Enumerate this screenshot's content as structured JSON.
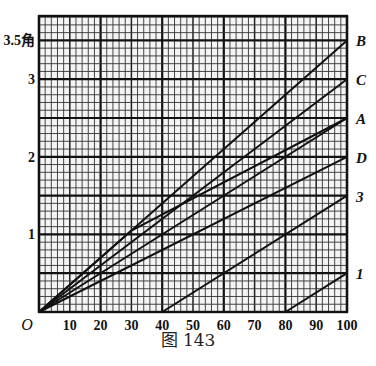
{
  "chart_data": {
    "type": "line",
    "title": "",
    "caption": "图 143",
    "xlabel": "",
    "ylabel": "角",
    "origin_label": "O",
    "xlim": [
      0,
      100
    ],
    "ylim": [
      0,
      3.8
    ],
    "x_ticks": [
      10,
      20,
      30,
      40,
      50,
      60,
      70,
      80,
      90,
      100
    ],
    "y_ticks": [
      {
        "value": 1,
        "label": "1"
      },
      {
        "value": 2,
        "label": "2"
      },
      {
        "value": 3,
        "label": "3"
      },
      {
        "value": 3.5,
        "label": "3.5角"
      }
    ],
    "grid": {
      "minor_x": 2,
      "major_x": 10,
      "heavy_x": 20,
      "minor_y": 0.1,
      "heavy_y": 0.5
    },
    "series": [
      {
        "name": "B",
        "points": [
          [
            0,
            0
          ],
          [
            100,
            3.5
          ]
        ]
      },
      {
        "name": "C",
        "points": [
          [
            0,
            0
          ],
          [
            100,
            3.0
          ]
        ]
      },
      {
        "name": "A",
        "points": [
          [
            0,
            0
          ],
          [
            100,
            2.5
          ]
        ]
      },
      {
        "name": "A-bent",
        "label": "",
        "points": [
          [
            0,
            0
          ],
          [
            30,
            1.05
          ],
          [
            100,
            2.5
          ]
        ]
      },
      {
        "name": "D",
        "points": [
          [
            0,
            0
          ],
          [
            100,
            2.0
          ]
        ]
      },
      {
        "name": "3",
        "points": [
          [
            40,
            0
          ],
          [
            100,
            1.5
          ]
        ]
      },
      {
        "name": "1",
        "points": [
          [
            80,
            0
          ],
          [
            100,
            0.5
          ]
        ]
      }
    ]
  }
}
